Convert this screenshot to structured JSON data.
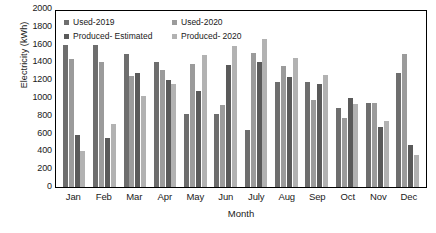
{
  "chart_data": {
    "type": "bar",
    "title": "",
    "xlabel": "Month",
    "ylabel": "Electricity (kWh)",
    "ylim": [
      0,
      2000
    ],
    "ytick_step": 200,
    "yticks": [
      2000,
      1800,
      1600,
      1400,
      1200,
      1000,
      800,
      600,
      400,
      200,
      0
    ],
    "grid": false,
    "legend_position": "top-left-inside",
    "categories": [
      "Jan",
      "Feb",
      "Mar",
      "Apr",
      "May",
      "Jun",
      "July",
      "Aug",
      "Sep",
      "Oct",
      "Nov",
      "Dec"
    ],
    "series": [
      {
        "name": "Used-2019",
        "color": "#6e6e6e",
        "values": [
          1600,
          1595,
          1500,
          1400,
          825,
          825,
          645,
          1185,
          1185,
          885,
          940,
          1285
        ]
      },
      {
        "name": "Used-2020",
        "color": "#9b9b9b",
        "values": [
          1440,
          1410,
          1250,
          1310,
          1380,
          925,
          1510,
          1360,
          980,
          780,
          940,
          1490
        ]
      },
      {
        "name": "Produced- Estimated",
        "color": "#5a5a5a",
        "values": [
          590,
          555,
          1280,
          1200,
          1075,
          1370,
          1405,
          1235,
          1155,
          995,
          675,
          475
        ]
      },
      {
        "name": "Produced- 2020",
        "color": "#b2b2b2",
        "values": [
          400,
          710,
          1025,
          1160,
          1485,
          1590,
          1665,
          1455,
          1255,
          930,
          745,
          360
        ]
      }
    ]
  }
}
